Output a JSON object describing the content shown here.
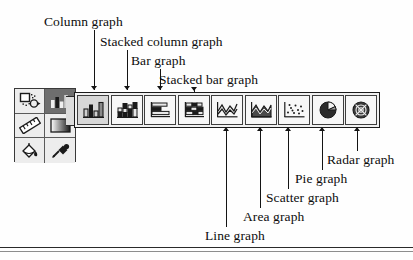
{
  "figure": {
    "kind": "graph-tool-flyout-toolbar-callout-diagram",
    "background_color": "#fefefe",
    "ink_color": "#141414"
  },
  "top_labels": [
    {
      "id": "column-graph",
      "text": "Column graph",
      "x": 44,
      "y": 14,
      "leader_x": 94,
      "leader_top": 30,
      "leader_bottom": 90
    },
    {
      "id": "stacked-column-graph",
      "text": "Stacked column graph",
      "x": 100,
      "y": 34,
      "leader_x": 127,
      "leader_top": 50,
      "leader_bottom": 90
    },
    {
      "id": "bar-graph",
      "text": "Bar graph",
      "x": 131,
      "y": 53,
      "leader_x": 160,
      "leader_top": 69,
      "leader_bottom": 90
    },
    {
      "id": "stacked-bar-graph",
      "text": "Stacked bar graph",
      "x": 159,
      "y": 72,
      "leader_x": 194,
      "leader_top": 86,
      "leader_bottom": 90
    }
  ],
  "bottom_labels": [
    {
      "id": "line-graph",
      "text": "Line graph",
      "x": 205,
      "y": 230,
      "leader_x": 226,
      "leader_top": 130,
      "leader_bottom": 227
    },
    {
      "id": "area-graph",
      "text": "Area graph",
      "x": 243,
      "y": 211,
      "leader_x": 260,
      "leader_top": 130,
      "leader_bottom": 208
    },
    {
      "id": "scatter-graph",
      "text": "Scatter graph",
      "x": 266,
      "y": 192,
      "leader_x": 288,
      "leader_top": 130,
      "leader_bottom": 189
    },
    {
      "id": "pie-graph",
      "text": "Pie graph",
      "x": 295,
      "y": 173,
      "leader_x": 322,
      "leader_top": 130,
      "leader_bottom": 170
    },
    {
      "id": "radar-graph",
      "text": "Radar graph",
      "x": 327,
      "y": 154,
      "leader_x": 357,
      "leader_top": 130,
      "leader_bottom": 151
    }
  ],
  "flyout_toolbar": {
    "name": "Graph tool flyout",
    "selected_index": 0,
    "items": [
      {
        "id": "column-graph-tool",
        "label": "Column graph",
        "icon": "column-graph-icon",
        "selected": true
      },
      {
        "id": "stacked-column-graph-tool",
        "label": "Stacked column graph",
        "icon": "stacked-column-graph-icon",
        "selected": false
      },
      {
        "id": "bar-graph-tool",
        "label": "Bar graph",
        "icon": "bar-graph-icon",
        "selected": false
      },
      {
        "id": "stacked-bar-graph-tool",
        "label": "Stacked bar graph",
        "icon": "stacked-bar-graph-icon",
        "selected": false
      },
      {
        "id": "line-graph-tool",
        "label": "Line graph",
        "icon": "line-graph-icon",
        "selected": false
      },
      {
        "id": "area-graph-tool",
        "label": "Area graph",
        "icon": "area-graph-icon",
        "selected": false
      },
      {
        "id": "scatter-graph-tool",
        "label": "Scatter graph",
        "icon": "scatter-graph-icon",
        "selected": false
      },
      {
        "id": "pie-graph-tool",
        "label": "Pie graph",
        "icon": "pie-graph-icon",
        "selected": false
      },
      {
        "id": "radar-graph-tool",
        "label": "Radar graph",
        "icon": "radar-graph-icon",
        "selected": false
      }
    ]
  },
  "tool_palette": {
    "name": "Tool palette",
    "rows": [
      [
        {
          "id": "selection-tool",
          "icon": "shape-select-icon",
          "selected": false
        },
        {
          "id": "graph-tool",
          "icon": "column-graph-icon",
          "selected": true
        }
      ],
      [
        {
          "id": "measure-tool",
          "icon": "ruler-icon",
          "selected": false
        },
        {
          "id": "gradient-tool",
          "icon": "gradient-icon",
          "selected": false
        }
      ],
      [
        {
          "id": "paint-bucket-tool",
          "icon": "paint-bucket-icon",
          "selected": false
        },
        {
          "id": "eyedropper-tool",
          "icon": "eyedropper-icon",
          "selected": false
        }
      ]
    ]
  }
}
